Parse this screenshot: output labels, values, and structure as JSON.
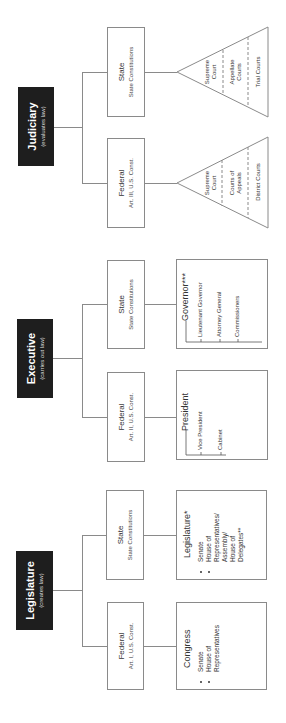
{
  "branches": [
    {
      "id": "judiciary",
      "title": "Judiciary",
      "subtitle": "(evaluates law)",
      "federal": {
        "title": "Federal",
        "source": "Art. III, U.S. Const."
      },
      "state": {
        "title": "State",
        "source": "State Constitutions"
      },
      "federal_courts": [
        "Supreme Court",
        "Courts of Appeals",
        "District Courts"
      ],
      "state_courts": [
        "Supreme Court",
        "Appellate Courts",
        "Trial Courts"
      ]
    },
    {
      "id": "executive",
      "title": "Executive",
      "subtitle": "(carries out law)",
      "federal": {
        "title": "Federal",
        "source": "Art. II, U.S. Const."
      },
      "state": {
        "title": "State",
        "source": "State Constitutions"
      },
      "federal_detail": {
        "head": "President",
        "items": [
          "Vice President",
          "Cabinet"
        ]
      },
      "state_detail": {
        "head": "Governor***",
        "items": [
          "Lieutenant Governor",
          "Attorney General",
          "Commissioners"
        ]
      }
    },
    {
      "id": "legislature",
      "title": "Legislature",
      "subtitle": "(creates law)",
      "federal": {
        "title": "Federal",
        "source": "Art. I, U.S. Const."
      },
      "state": {
        "title": "State",
        "source": "State Constitutions"
      },
      "federal_detail": {
        "head": "Congress",
        "items": [
          "Senate",
          "House of Representatives"
        ]
      },
      "state_detail": {
        "head": "Legislature*",
        "items": [
          "Senate",
          "House of Representatives/ Assembly/ House of Delegates**"
        ]
      }
    }
  ],
  "colors": {
    "branch_box": "#1e1e1e",
    "line": "#8a8a8a",
    "text": "#333333",
    "background": "#ffffff"
  }
}
